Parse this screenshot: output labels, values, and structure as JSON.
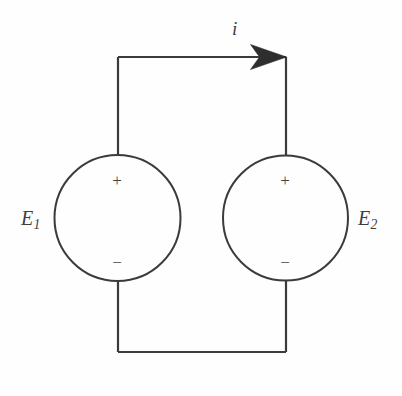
{
  "figure": {
    "kind": "circuit-diagram",
    "width": 402,
    "height": 396,
    "background_color": "#fefefe",
    "line_color": "#3b3b3b",
    "text_color": "#3d3d3d"
  },
  "labels": {
    "current": "i",
    "source_left": "E",
    "source_left_subscript": "1",
    "source_right": "E",
    "source_right_subscript": "2"
  },
  "sources": [
    {
      "name": "E1",
      "label_base": "E",
      "label_sub": "1",
      "plus": "+",
      "minus": "−",
      "center_x": 117.5,
      "center_y": 218,
      "radius": 63
    },
    {
      "name": "E2",
      "label_base": "E",
      "label_sub": "2",
      "plus": "+",
      "minus": "−",
      "center_x": 285.5,
      "center_y": 218,
      "radius": 62.5
    }
  ],
  "current_arrow": {
    "symbol": "i",
    "direction": "right",
    "on_wire": "top"
  },
  "wires": {
    "top_y": 57,
    "bottom_y": 352,
    "left_x": 118,
    "right_x": 286
  }
}
